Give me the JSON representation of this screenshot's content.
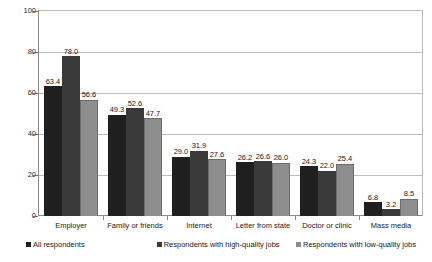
{
  "chart_data": {
    "type": "bar",
    "title": "",
    "subtitle": "",
    "xlabel": "",
    "ylabel": "Percent",
    "ylim": [
      0,
      100
    ],
    "yticks": [
      0,
      20,
      40,
      60,
      80,
      100
    ],
    "ytick_labels": [
      "0",
      "20",
      "40",
      "60",
      "80",
      "100"
    ],
    "grid": true,
    "legend_position": "bottom",
    "value_labels": true,
    "categories": [
      "Employer",
      "Family or friends",
      "Internet",
      "Letter from state",
      "Doctor or clinic",
      "Mass media"
    ],
    "series": [
      {
        "name": "All respondents",
        "color": "#1f1f1f",
        "values": [
          63.4,
          49.3,
          29.0,
          26.2,
          24.3,
          6.8
        ],
        "labels": [
          "63.4",
          "49.3",
          "29.0",
          "26.2",
          "24.3",
          "6.8"
        ]
      },
      {
        "name": "Respondents with high-quality jobs",
        "color": "#3a3a3a",
        "values": [
          78.0,
          52.6,
          31.9,
          26.6,
          22.0,
          3.2
        ],
        "labels": [
          "78.0",
          "52.6",
          "31.9",
          "26.6",
          "22.0",
          "3.2"
        ]
      },
      {
        "name": "Respondents with low-quality jobs",
        "color": "#8e8e8e",
        "values": [
          56.6,
          47.7,
          27.6,
          26.0,
          25.4,
          8.5
        ],
        "labels": [
          "56.6",
          "47.7",
          "27.6",
          "26.0",
          "25.4",
          "8.5"
        ]
      }
    ]
  }
}
